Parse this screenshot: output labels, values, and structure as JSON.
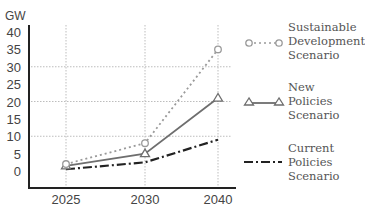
{
  "chart_data": {
    "type": "line",
    "title": "",
    "xlabel": "",
    "ylabel": "GW",
    "categories": [
      "2025",
      "2030",
      "2040"
    ],
    "ylim": [
      0,
      40
    ],
    "yticks": [
      "0",
      "5",
      "10",
      "15",
      "20",
      "25",
      "30",
      "35",
      "40"
    ],
    "grid": {
      "horizontal_at": [
        10,
        20,
        30
      ],
      "vertical_at": [
        "2025",
        "2030",
        "2040"
      ],
      "style": "dotted"
    },
    "legend_position": "right",
    "series": [
      {
        "name": "Sustainable Development Scenario",
        "values": [
          2,
          8,
          35
        ],
        "style": "dotted",
        "marker": "circle",
        "color": "#9a9a9a"
      },
      {
        "name": "New Policies Scenario",
        "values": [
          1.5,
          5,
          21
        ],
        "style": "solid",
        "marker": "triangle",
        "color": "#6e6e6e"
      },
      {
        "name": "Current Policies Scenario",
        "values": [
          0.5,
          2.5,
          9
        ],
        "style": "dash-dot",
        "marker": "none",
        "color": "#222222"
      }
    ]
  },
  "axis": {
    "y_unit": "GW",
    "y_ticks": [
      "40",
      "35",
      "30",
      "25",
      "20",
      "15",
      "10",
      "5",
      "0"
    ],
    "x_ticks": [
      "2025",
      "2030",
      "2040"
    ]
  },
  "legend": {
    "sds": "Sustainable\nDevelopment\nScenario",
    "nps": "New\nPolicies\nScenario",
    "cps": "Current\nPolicies\nScenario"
  }
}
